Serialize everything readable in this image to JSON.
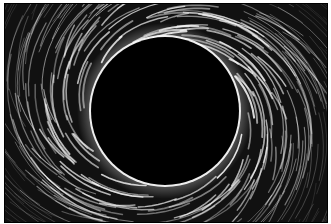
{
  "image": {
    "subject": "engraving of a total solar eclipse with swirling corona",
    "colors": {
      "background": "#ffffff",
      "field": "#111111",
      "disk": "#000000",
      "streaks": "#ffffff"
    },
    "disk": {
      "cx": 160,
      "cy": 107,
      "r": 74
    }
  }
}
